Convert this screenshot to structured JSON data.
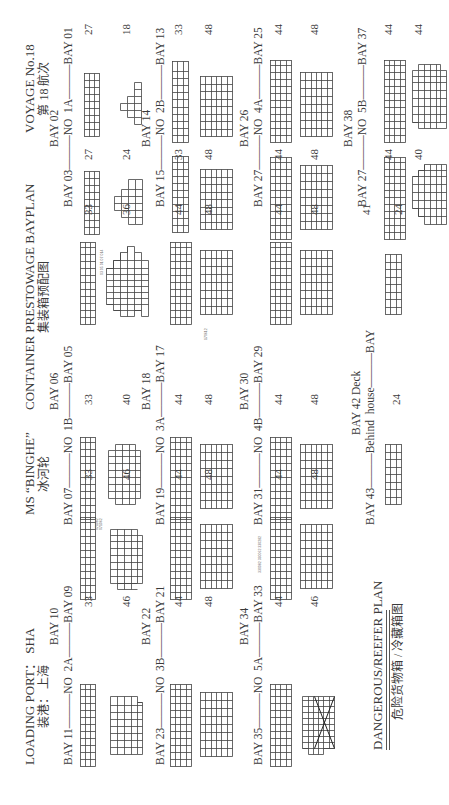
{
  "header": {
    "loading_port": "LOADING PORT： SHA",
    "loading_port_zh": "装港： 上海",
    "vessel": "MS “BINGHE”",
    "vessel_zh": "冰河轮",
    "plan_title": "CONTAINER PRESTOWAGE BAYPLAN",
    "plan_title_zh": "集装箱预配图",
    "voyage": "VOYAGE No.18",
    "voyage_zh": "第 18 航次"
  },
  "groups": [
    {
      "top": "BAY 10",
      "left": "BAY 11",
      "mid": "NO",
      "right": "2A",
      "right_bay": "BAY 09",
      "left_deck": "33",
      "left_hold": "46",
      "right_deck": "33",
      "right_hold": "46"
    },
    {
      "top": "BAY 06",
      "left": "BAY 07",
      "mid": "NO",
      "right": "1B",
      "right_bay": "BAY 05",
      "left_deck": "33",
      "left_hold": "40",
      "right_deck": "33",
      "right_hold": "36"
    },
    {
      "top": "BAY 02",
      "left": "BAY 03",
      "mid": "NO",
      "right": "1A",
      "right_bay": "BAY 01",
      "left_deck": "27",
      "left_hold": "24",
      "right_deck": "27",
      "right_hold": "18"
    },
    {
      "top": "BAY 22",
      "left": "BAY 23",
      "mid": "NO",
      "right": "3B",
      "right_bay": "BAY 21",
      "left_deck": "44",
      "left_hold": "48",
      "right_deck": "44",
      "right_hold": "48"
    },
    {
      "top": "BAY 18",
      "left": "BAY 19",
      "mid": "NO",
      "right": "3A",
      "right_bay": "BAY 17",
      "left_deck": "44",
      "left_hold": "48",
      "right_deck": "44",
      "right_hold": "48"
    },
    {
      "top": "BAY 14",
      "left": "BAY 15",
      "mid": "NO",
      "right": "2B",
      "right_bay": "BAY 13",
      "left_deck": "33",
      "left_hold": "48",
      "right_deck": "33",
      "right_hold": "48"
    },
    {
      "top": "BAY 34",
      "left": "BAY 35",
      "mid": "NO",
      "right": "5A",
      "right_bay": "BAY 33",
      "left_deck": "44",
      "left_hold": "46",
      "right_deck": "44",
      "right_hold": "48"
    },
    {
      "top": "BAY 30",
      "left": "BAY 31",
      "mid": "NO",
      "right": "4B",
      "right_bay": "BAY 29",
      "left_deck": "44",
      "left_hold": "48",
      "right_deck": "44",
      "right_hold": "48"
    },
    {
      "top": "BAY 26",
      "left": "BAY 27",
      "mid": "NO",
      "right": "4A",
      "right_bay": "BAY 25",
      "left_deck": "44",
      "left_hold": "48",
      "right_deck": "44",
      "right_hold": "48"
    },
    {
      "top": "BAY 42 Deck",
      "left": "BAY 43",
      "mid": "Behind",
      "right": "house",
      "right_bay": "BAY",
      "left_deck": "24",
      "left_hold": "",
      "right_deck": "41",
      "right_hold": "24"
    },
    {
      "top": "BAY 38",
      "left": "BAY 27",
      "mid": "NO",
      "right": "5B",
      "right_bay": "BAY  37",
      "left_deck": "44",
      "left_hold": "40",
      "right_deck": "44",
      "right_hold": "44"
    }
  ],
  "reefer_plan": {
    "title": "DANGEROUS/REEFER PLAN",
    "title_zh": "危险货物箱 / 冷藏箱图"
  },
  "annotations": {
    "bay05_hold": [
      "03 05 01 07",
      "014",
      "050312",
      "050310",
      "050712",
      "050710",
      "0700"
    ],
    "bay07_deck": [
      "071082",
      "071062"
    ],
    "bay33_deck": [
      "330082",
      "330062",
      "330282",
      "330262",
      "330302"
    ],
    "bay17_hold": "170612"
  }
}
